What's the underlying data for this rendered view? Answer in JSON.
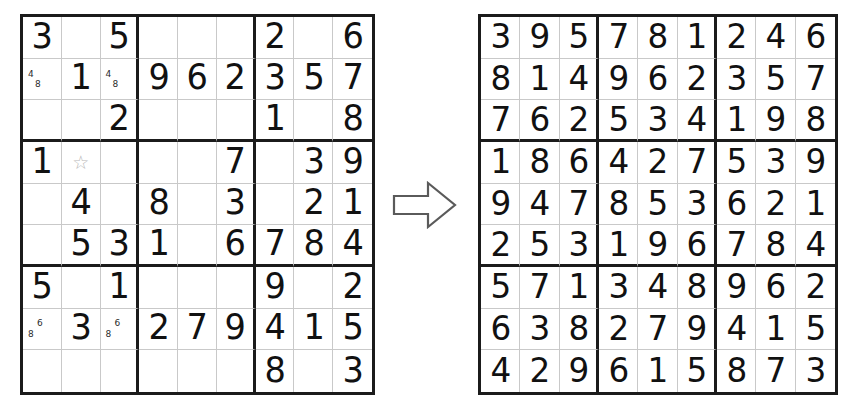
{
  "document": {
    "title": "Sudoku puzzle and solution",
    "background_color": "#ffffff",
    "grid_line_color": "#1b1b1b",
    "thin_line_color": "#c9c9c9",
    "digit_color": "#111111",
    "pencil_mark_color": "#2b2b2b",
    "star_color": "#b9b9b9",
    "arrow_color": "#5a5a5a"
  },
  "arrow": {
    "icon": "right-arrow-outline-icon",
    "direction": "right",
    "label": "leads to"
  },
  "puzzle": {
    "label": "Sudoku puzzle with candidate marks",
    "rows": [
      [
        {
          "value": "3"
        },
        {
          "value": ""
        },
        {
          "value": "5"
        },
        {
          "value": ""
        },
        {
          "value": ""
        },
        {
          "value": ""
        },
        {
          "value": "2"
        },
        {
          "value": ""
        },
        {
          "value": "6"
        }
      ],
      [
        {
          "value": "",
          "marks_ul": "4",
          "marks_lr": "8"
        },
        {
          "value": "1"
        },
        {
          "value": "",
          "marks_ul": "4",
          "marks_lr": "8"
        },
        {
          "value": "9"
        },
        {
          "value": "6"
        },
        {
          "value": "2"
        },
        {
          "value": "3"
        },
        {
          "value": "5"
        },
        {
          "value": "7"
        }
      ],
      [
        {
          "value": ""
        },
        {
          "value": ""
        },
        {
          "value": "2"
        },
        {
          "value": ""
        },
        {
          "value": ""
        },
        {
          "value": ""
        },
        {
          "value": "1"
        },
        {
          "value": ""
        },
        {
          "value": "8"
        }
      ],
      [
        {
          "value": "1"
        },
        {
          "value": "",
          "star": "☆"
        },
        {
          "value": ""
        },
        {
          "value": ""
        },
        {
          "value": ""
        },
        {
          "value": "7"
        },
        {
          "value": ""
        },
        {
          "value": "3"
        },
        {
          "value": "9"
        }
      ],
      [
        {
          "value": ""
        },
        {
          "value": "4"
        },
        {
          "value": ""
        },
        {
          "value": "8"
        },
        {
          "value": ""
        },
        {
          "value": "3"
        },
        {
          "value": ""
        },
        {
          "value": "2"
        },
        {
          "value": "1"
        }
      ],
      [
        {
          "value": ""
        },
        {
          "value": "5"
        },
        {
          "value": "3"
        },
        {
          "value": "1"
        },
        {
          "value": ""
        },
        {
          "value": "6"
        },
        {
          "value": "7"
        },
        {
          "value": "8"
        },
        {
          "value": "4"
        }
      ],
      [
        {
          "value": "5"
        },
        {
          "value": ""
        },
        {
          "value": "1"
        },
        {
          "value": ""
        },
        {
          "value": ""
        },
        {
          "value": ""
        },
        {
          "value": "9"
        },
        {
          "value": ""
        },
        {
          "value": "2"
        }
      ],
      [
        {
          "value": "",
          "marks_ur": "6",
          "marks_ll": "8"
        },
        {
          "value": "3"
        },
        {
          "value": "",
          "marks_ur": "6",
          "marks_ll": "8"
        },
        {
          "value": "2"
        },
        {
          "value": "7"
        },
        {
          "value": "9"
        },
        {
          "value": "4"
        },
        {
          "value": "1"
        },
        {
          "value": "5"
        }
      ],
      [
        {
          "value": ""
        },
        {
          "value": ""
        },
        {
          "value": ""
        },
        {
          "value": ""
        },
        {
          "value": ""
        },
        {
          "value": ""
        },
        {
          "value": "8"
        },
        {
          "value": ""
        },
        {
          "value": "3"
        }
      ]
    ]
  },
  "solution": {
    "label": "Completed sudoku solution",
    "rows": [
      [
        {
          "value": "3"
        },
        {
          "value": "9"
        },
        {
          "value": "5"
        },
        {
          "value": "7"
        },
        {
          "value": "8"
        },
        {
          "value": "1"
        },
        {
          "value": "2"
        },
        {
          "value": "4"
        },
        {
          "value": "6"
        }
      ],
      [
        {
          "value": "8"
        },
        {
          "value": "1"
        },
        {
          "value": "4"
        },
        {
          "value": "9"
        },
        {
          "value": "6"
        },
        {
          "value": "2"
        },
        {
          "value": "3"
        },
        {
          "value": "5"
        },
        {
          "value": "7"
        }
      ],
      [
        {
          "value": "7"
        },
        {
          "value": "6"
        },
        {
          "value": "2"
        },
        {
          "value": "5"
        },
        {
          "value": "3"
        },
        {
          "value": "4"
        },
        {
          "value": "1"
        },
        {
          "value": "9"
        },
        {
          "value": "8"
        }
      ],
      [
        {
          "value": "1"
        },
        {
          "value": "8"
        },
        {
          "value": "6"
        },
        {
          "value": "4"
        },
        {
          "value": "2"
        },
        {
          "value": "7"
        },
        {
          "value": "5"
        },
        {
          "value": "3"
        },
        {
          "value": "9"
        }
      ],
      [
        {
          "value": "9"
        },
        {
          "value": "4"
        },
        {
          "value": "7"
        },
        {
          "value": "8"
        },
        {
          "value": "5"
        },
        {
          "value": "3"
        },
        {
          "value": "6"
        },
        {
          "value": "2"
        },
        {
          "value": "1"
        }
      ],
      [
        {
          "value": "2"
        },
        {
          "value": "5"
        },
        {
          "value": "3"
        },
        {
          "value": "1"
        },
        {
          "value": "9"
        },
        {
          "value": "6"
        },
        {
          "value": "7"
        },
        {
          "value": "8"
        },
        {
          "value": "4"
        }
      ],
      [
        {
          "value": "5"
        },
        {
          "value": "7"
        },
        {
          "value": "1"
        },
        {
          "value": "3"
        },
        {
          "value": "4"
        },
        {
          "value": "8"
        },
        {
          "value": "9"
        },
        {
          "value": "6"
        },
        {
          "value": "2"
        }
      ],
      [
        {
          "value": "6"
        },
        {
          "value": "3"
        },
        {
          "value": "8"
        },
        {
          "value": "2"
        },
        {
          "value": "7"
        },
        {
          "value": "9"
        },
        {
          "value": "4"
        },
        {
          "value": "1"
        },
        {
          "value": "5"
        }
      ],
      [
        {
          "value": "4"
        },
        {
          "value": "2"
        },
        {
          "value": "9"
        },
        {
          "value": "6"
        },
        {
          "value": "1"
        },
        {
          "value": "5"
        },
        {
          "value": "8"
        },
        {
          "value": "7"
        },
        {
          "value": "3"
        }
      ]
    ]
  }
}
